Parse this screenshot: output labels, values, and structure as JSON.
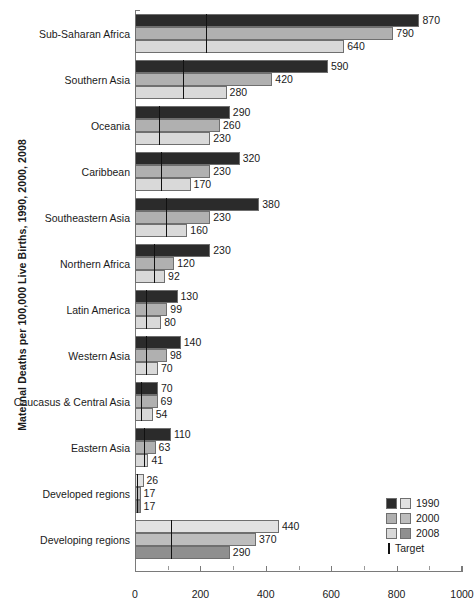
{
  "chart_data": {
    "type": "bar",
    "orientation": "horizontal",
    "title": "",
    "ylabel": "Maternal Deaths per 100,000 Live Births, 1990, 2000, 2008",
    "xlabel": "",
    "xlim": [
      0,
      1000
    ],
    "xticks": [
      0,
      200,
      400,
      600,
      800,
      1000
    ],
    "xtick_labels": [
      "0",
      "200",
      "400",
      "600",
      "800",
      "1000"
    ],
    "minor_ticks": [
      100,
      300,
      500,
      700,
      900
    ],
    "grid": false,
    "legend_position": "bottom-right",
    "categories": [
      "Sub-Saharan Africa",
      "Southern Asia",
      "Oceania",
      "Caribbean",
      "Southeastern Asia",
      "Northern Africa",
      "Latin America",
      "Western Asia",
      "Caucasus & Central Asia",
      "Eastern Asia",
      "Developed regions",
      "Developing regions"
    ],
    "series": [
      {
        "name": "1990",
        "values": [
          870,
          590,
          290,
          320,
          380,
          230,
          130,
          140,
          70,
          110,
          26,
          440
        ]
      },
      {
        "name": "2000",
        "values": [
          790,
          420,
          260,
          230,
          230,
          120,
          99,
          98,
          69,
          63,
          17,
          370
        ]
      },
      {
        "name": "2008",
        "values": [
          640,
          280,
          230,
          170,
          160,
          92,
          80,
          70,
          54,
          41,
          17,
          290
        ]
      }
    ],
    "target_values": [
      218,
      148,
      73,
      80,
      95,
      58,
      33,
      35,
      18,
      28,
      7,
      110
    ],
    "target_label": "Target",
    "legend_entries": [
      "1990",
      "2000",
      "2008"
    ],
    "colors": {
      "series_1990": "#2b2b2b",
      "series_2000": "#b0b0b0",
      "series_2008": "#d9d9d9",
      "series_1990_alt": "#e2e2e2",
      "series_2000_alt": "#bdbdbd",
      "series_2008_alt": "#8f8f8f",
      "target": "#111111",
      "axis": "#7a7a7a",
      "text": "#1a1a1a",
      "background": "#ffffff"
    },
    "value_labels": [
      [
        "870",
        "790",
        "640"
      ],
      [
        "590",
        "420",
        "280"
      ],
      [
        "290",
        "260",
        "230"
      ],
      [
        "320",
        "230",
        "170"
      ],
      [
        "380",
        "230",
        "160"
      ],
      [
        "230",
        "120",
        "92"
      ],
      [
        "130",
        "99",
        "80"
      ],
      [
        "140",
        "98",
        "70"
      ],
      [
        "70",
        "69",
        "54"
      ],
      [
        "110",
        "63",
        "41"
      ],
      [
        "26",
        "17",
        "17"
      ],
      [
        "440",
        "370",
        "290"
      ]
    ]
  }
}
